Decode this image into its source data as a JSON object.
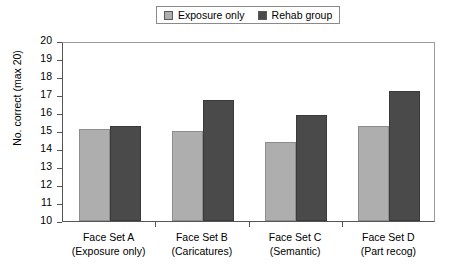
{
  "legend": {
    "entries": [
      {
        "label": "Exposure only",
        "color": "#aeaeae",
        "swatch_name": "legend-swatch-exposure-only"
      },
      {
        "label": "Rehab group",
        "color": "#4a4a4a",
        "swatch_name": "legend-swatch-rehab-group"
      }
    ]
  },
  "chart_data": {
    "type": "bar",
    "title": "",
    "xlabel": "",
    "ylabel": "No. correct (max 20)",
    "ylim": [
      10,
      20
    ],
    "yticks": [
      20,
      19,
      18,
      17,
      16,
      15,
      14,
      13,
      12,
      11,
      10
    ],
    "grid": false,
    "legend_position": "top-center",
    "categories": [
      "Face Set A\n(Exposure only)",
      "Face Set B\n(Caricatures)",
      "Face Set C\n(Semantic)",
      "Face Set D\n(Part recog)"
    ],
    "category_lines": [
      {
        "line1": "Face Set A",
        "line2": "(Exposure only)"
      },
      {
        "line1": "Face Set B",
        "line2": "(Caricatures)"
      },
      {
        "line1": "Face Set C",
        "line2": "(Semantic)"
      },
      {
        "line1": "Face Set D",
        "line2": "(Part recog)"
      }
    ],
    "series": [
      {
        "name": "Exposure only",
        "color": "#aeaeae",
        "values": [
          15.1,
          15.0,
          14.4,
          15.3
        ]
      },
      {
        "name": "Rehab group",
        "color": "#4a4a4a",
        "values": [
          15.3,
          16.7,
          15.9,
          17.2
        ]
      }
    ]
  }
}
